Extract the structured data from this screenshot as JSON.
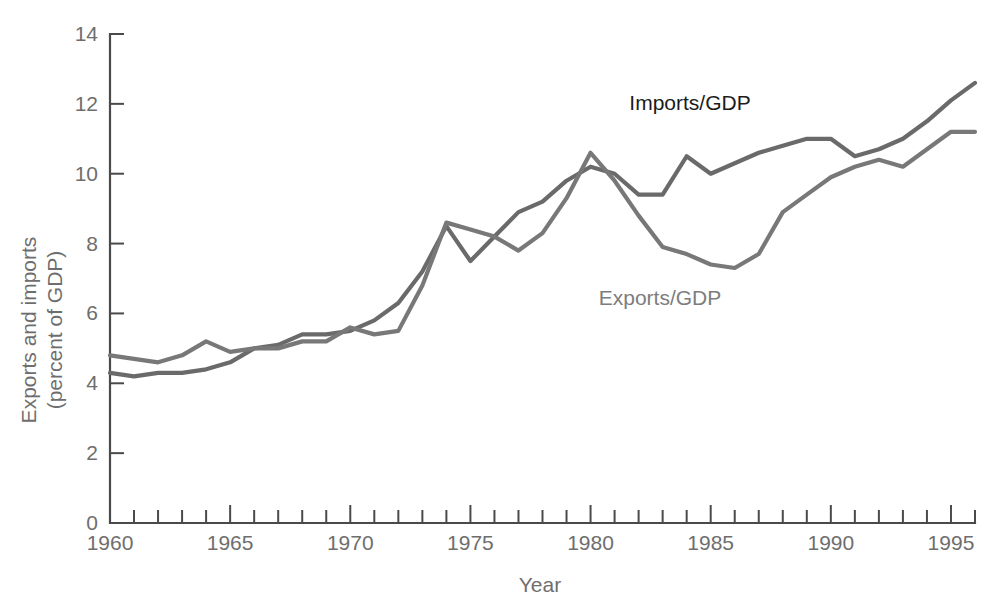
{
  "chart_data": {
    "type": "line",
    "title": "",
    "xlabel": "Year",
    "ylabel": "Exports and imports (percent of GDP)",
    "ylabel_line1": "Exports and imports",
    "ylabel_line2": "(percent of GDP)",
    "xlim": [
      1960,
      1996
    ],
    "ylim": [
      0,
      14
    ],
    "ytick_labels": [
      "0",
      "2",
      "4",
      "6",
      "8",
      "10",
      "12",
      "14"
    ],
    "ytick_values": [
      0,
      2,
      4,
      6,
      8,
      10,
      12,
      14
    ],
    "xtick_labels": [
      "1960",
      "1965",
      "1970",
      "1975",
      "1980",
      "1985",
      "1990",
      "1995"
    ],
    "xtick_values": [
      1960,
      1965,
      1970,
      1975,
      1980,
      1985,
      1990,
      1995
    ],
    "xtick_minor_values": [
      1961,
      1962,
      1963,
      1964,
      1966,
      1967,
      1968,
      1969,
      1971,
      1972,
      1973,
      1974,
      1976,
      1977,
      1978,
      1979,
      1981,
      1982,
      1983,
      1984,
      1986,
      1987,
      1988,
      1989,
      1991,
      1992,
      1993,
      1994,
      1996
    ],
    "grid": false,
    "legend_position": "inline-annotations",
    "x": [
      1960,
      1961,
      1962,
      1963,
      1964,
      1965,
      1966,
      1967,
      1968,
      1969,
      1970,
      1971,
      1972,
      1973,
      1974,
      1975,
      1976,
      1977,
      1978,
      1979,
      1980,
      1981,
      1982,
      1983,
      1984,
      1985,
      1986,
      1987,
      1988,
      1989,
      1990,
      1991,
      1992,
      1993,
      1994,
      1995,
      1996
    ],
    "series": [
      {
        "name": "Imports/GDP",
        "color": "#6a6a6a",
        "label_color": "#1c1c1c",
        "values": [
          4.3,
          4.2,
          4.3,
          4.3,
          4.4,
          4.6,
          5.0,
          5.1,
          5.4,
          5.4,
          5.5,
          5.8,
          6.3,
          7.2,
          8.5,
          7.5,
          8.2,
          8.9,
          9.2,
          9.8,
          10.2,
          10.0,
          9.4,
          9.4,
          10.5,
          10.0,
          10.3,
          10.6,
          10.8,
          11.0,
          11.0,
          10.5,
          10.7,
          11.0,
          11.5,
          12.1,
          12.6
        ]
      },
      {
        "name": "Exports/GDP",
        "color": "#787878",
        "label_color": "#7d7d7d",
        "values": [
          4.8,
          4.7,
          4.6,
          4.8,
          5.2,
          4.9,
          5.0,
          5.0,
          5.2,
          5.2,
          5.6,
          5.4,
          5.5,
          6.8,
          8.6,
          8.4,
          8.2,
          7.8,
          8.3,
          9.3,
          10.6,
          9.8,
          8.8,
          7.9,
          7.7,
          7.4,
          7.3,
          7.7,
          8.9,
          9.4,
          9.9,
          10.2,
          10.4,
          10.2,
          10.7,
          11.2,
          11.2
        ]
      }
    ],
    "annotations": [
      {
        "text": "Imports/GDP",
        "x_px": 690,
        "y_px": 110,
        "style": "dark"
      },
      {
        "text": "Exports/GDP",
        "x_px": 660,
        "y_px": 305,
        "style": "light"
      }
    ]
  }
}
